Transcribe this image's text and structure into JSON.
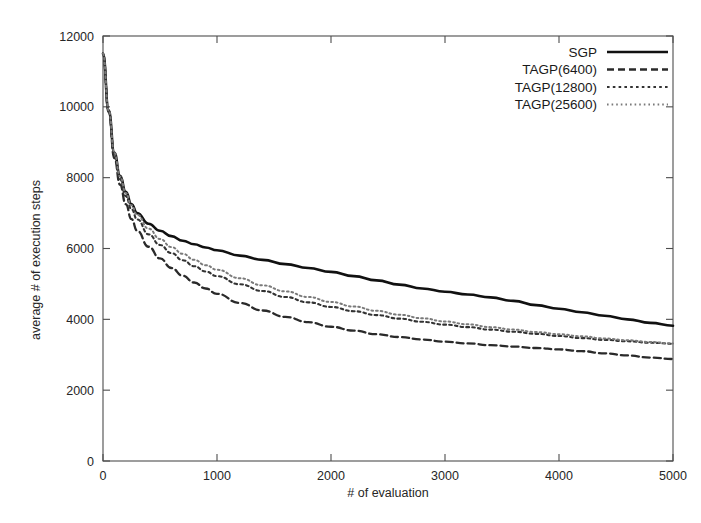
{
  "chart_data": {
    "type": "line",
    "title": "",
    "xlabel": "# of evaluation",
    "ylabel": "average # of execution steps",
    "xlim": [
      0,
      5000
    ],
    "ylim": [
      0,
      12000
    ],
    "xticks": [
      0,
      1000,
      2000,
      3000,
      4000,
      5000
    ],
    "yticks": [
      0,
      2000,
      4000,
      6000,
      8000,
      10000,
      12000
    ],
    "xtick_labels": [
      "0",
      "1000",
      "2000",
      "3000",
      "4000",
      "5000"
    ],
    "ytick_labels": [
      "0",
      "2000",
      "4000",
      "6000",
      "8000",
      "10000",
      "12000"
    ],
    "grid": false,
    "legend_position": "top-right",
    "x": [
      0,
      50,
      100,
      150,
      200,
      250,
      300,
      400,
      500,
      600,
      700,
      800,
      900,
      1000,
      1200,
      1400,
      1600,
      1800,
      2000,
      2200,
      2400,
      2600,
      2800,
      3000,
      3200,
      3400,
      3600,
      3800,
      4000,
      4200,
      4400,
      4600,
      4800,
      5000
    ],
    "series": [
      {
        "name": "SGP",
        "style": "solid",
        "color": "#111111",
        "width": 2.6,
        "values": [
          11500,
          9900,
          8700,
          8050,
          7600,
          7250,
          7000,
          6700,
          6500,
          6350,
          6220,
          6120,
          6030,
          5950,
          5800,
          5680,
          5560,
          5450,
          5340,
          5220,
          5100,
          4980,
          4870,
          4780,
          4700,
          4620,
          4520,
          4400,
          4300,
          4200,
          4100,
          4000,
          3900,
          3820
        ]
      },
      {
        "name": "TAGP(6400)",
        "style": "dashed",
        "color": "#2a2a2a",
        "width": 2.3,
        "values": [
          11500,
          9850,
          8550,
          7800,
          7250,
          6830,
          6500,
          6050,
          5720,
          5450,
          5230,
          5040,
          4870,
          4720,
          4460,
          4250,
          4070,
          3920,
          3790,
          3680,
          3580,
          3500,
          3430,
          3370,
          3320,
          3270,
          3230,
          3190,
          3150,
          3100,
          3040,
          2980,
          2920,
          2880
        ]
      },
      {
        "name": "TAGP(12800)",
        "style": "dotted",
        "color": "#333333",
        "width": 2.1,
        "values": [
          11500,
          9880,
          8650,
          7960,
          7480,
          7110,
          6820,
          6400,
          6100,
          5870,
          5670,
          5500,
          5350,
          5220,
          4990,
          4800,
          4630,
          4480,
          4350,
          4230,
          4120,
          4020,
          3930,
          3850,
          3780,
          3710,
          3650,
          3590,
          3530,
          3470,
          3420,
          3380,
          3340,
          3310
        ]
      },
      {
        "name": "TAGP(25600)",
        "style": "fine-dotted",
        "color": "#7a7a7a",
        "width": 2.0,
        "values": [
          11500,
          9900,
          8700,
          8030,
          7570,
          7220,
          6950,
          6560,
          6270,
          6040,
          5850,
          5680,
          5530,
          5400,
          5160,
          4960,
          4790,
          4630,
          4490,
          4360,
          4240,
          4130,
          4030,
          3940,
          3860,
          3780,
          3710,
          3640,
          3580,
          3520,
          3460,
          3410,
          3360,
          3320
        ]
      }
    ]
  },
  "legend": {
    "entries": [
      {
        "label": "SGP"
      },
      {
        "label": "TAGP(6400)"
      },
      {
        "label": "TAGP(12800)"
      },
      {
        "label": "TAGP(25600)"
      }
    ]
  }
}
